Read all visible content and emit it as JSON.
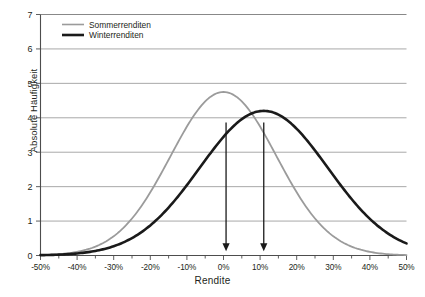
{
  "chart_data": {
    "type": "line",
    "title": "",
    "xlabel": "Rendite",
    "ylabel": "Absolute Häufigkeit",
    "xlim": [
      -50,
      50
    ],
    "ylim": [
      0,
      7
    ],
    "x_tick_labels": [
      "-50%",
      "-40%",
      "-30%",
      "-20%",
      "-10%",
      "0%",
      "10%",
      "20%",
      "30%",
      "40%",
      "50%"
    ],
    "x_tick_values": [
      -50,
      -40,
      -30,
      -20,
      -10,
      0,
      10,
      20,
      30,
      40,
      50
    ],
    "x_minor_tick_step": 5,
    "y_tick_labels": [
      "0",
      "1",
      "2",
      "3",
      "4",
      "5",
      "6",
      "7"
    ],
    "y_tick_values": [
      0,
      1,
      2,
      3,
      4,
      5,
      6,
      7
    ],
    "grid": "horizontal",
    "legend_position": "top-left",
    "series": [
      {
        "name": "Sommerrenditen",
        "color": "#9b9b9b",
        "line_width": 1.8,
        "peak_x": 0,
        "peak_y": 4.75,
        "sigma": 14.5,
        "x": [
          -50,
          -45,
          -40,
          -35,
          -30,
          -25,
          -20,
          -15,
          -10,
          -5,
          0,
          5,
          10,
          15,
          20,
          25,
          30,
          35,
          40,
          45,
          50
        ],
        "y": [
          0.01,
          0.03,
          0.08,
          0.2,
          0.43,
          0.85,
          1.51,
          2.4,
          3.44,
          4.35,
          4.75,
          4.35,
          3.44,
          2.4,
          1.51,
          0.85,
          0.43,
          0.2,
          0.08,
          0.03,
          0.01
        ]
      },
      {
        "name": "Winterrenditen",
        "color": "#1a1a1a",
        "line_width": 2.6,
        "peak_x": 11,
        "peak_y": 4.2,
        "sigma": 17.5,
        "x": [
          -50,
          -45,
          -40,
          -35,
          -30,
          -25,
          -20,
          -15,
          -10,
          -5,
          0,
          5,
          10,
          15,
          20,
          25,
          30,
          35,
          40,
          45,
          50
        ],
        "y": [
          0.01,
          0.03,
          0.07,
          0.15,
          0.3,
          0.56,
          0.97,
          1.55,
          2.29,
          3.08,
          3.79,
          4.16,
          4.2,
          3.9,
          3.28,
          2.53,
          1.79,
          1.16,
          0.69,
          0.42,
          0.28
        ]
      }
    ],
    "annotations": [
      {
        "type": "arrow",
        "label": "sommer-peak-arrow",
        "x": 0.7,
        "y_top": 3.86,
        "y_bottom": 0.12,
        "color": "#1a1a1a"
      },
      {
        "type": "arrow",
        "label": "winter-peak-arrow",
        "x": 11.0,
        "y_top": 3.86,
        "y_bottom": 0.12,
        "color": "#1a1a1a"
      }
    ]
  },
  "legend": {
    "items": [
      {
        "label": "Sommerrenditen"
      },
      {
        "label": "Winterrenditen"
      }
    ]
  },
  "axes": {
    "x_title": "Rendite",
    "y_title": "Absolute Häufigkeit"
  }
}
